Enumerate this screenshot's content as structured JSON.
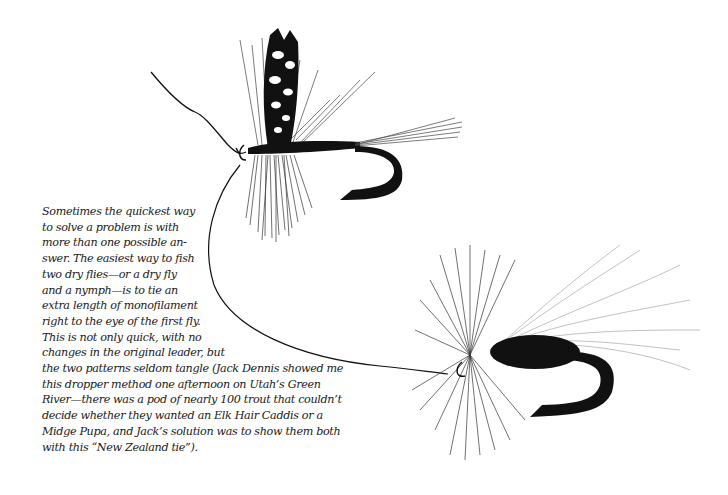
{
  "figure": {
    "flies": [
      {
        "name": "top-fly",
        "type": "dry fly with barred wing and hackle"
      },
      {
        "name": "bottom-fly",
        "type": "hair-wing dry fly (caddis style)"
      }
    ]
  },
  "caption": {
    "lines": [
      "Sometimes the quickest way",
      "to solve a problem is with",
      "more than one possible an-",
      "swer. The easiest way to fish",
      "two dry flies—or a dry fly",
      "and a nymph—is to tie an",
      "extra length of monofilament",
      "right to the eye of the first fly.",
      "This is not only quick, with no",
      "changes in the original leader, but",
      "the two patterns seldom tangle (Jack Dennis showed me",
      "this dropper method one afternoon on Utah’s Green",
      "River—there was a pod of nearly 100 trout that couldn’t",
      "decide whether they wanted an Elk Hair Caddis or a",
      "Midge Pupa, and Jack’s solution was to show them both",
      "with this “New Zealand tie”)."
    ]
  }
}
